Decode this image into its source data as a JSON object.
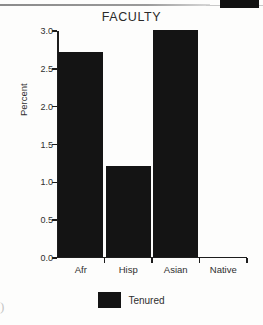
{
  "chart_data": {
    "type": "bar",
    "title": "FACULTY",
    "xlabel": "",
    "ylabel": "Percent",
    "categories": [
      "Afr",
      "Hisp",
      "Asian",
      "Native"
    ],
    "series": [
      {
        "name": "Tenured",
        "values": [
          2.7,
          1.2,
          3.0,
          0.0
        ],
        "color": "#141414"
      }
    ],
    "ylim": [
      0.0,
      3.0
    ],
    "yticks": [
      "0.0",
      "0.5",
      "1.0",
      "1.5",
      "2.0",
      "2.5",
      "3.0"
    ],
    "ytick_values": [
      0.0,
      0.5,
      1.0,
      1.5,
      2.0,
      2.5,
      3.0
    ],
    "grid": false,
    "legend_position": "bottom"
  },
  "legend": {
    "entries": [
      {
        "label": "Tenured",
        "color": "#141414"
      }
    ]
  },
  "artifacts": {
    "corner_glyph": ")"
  }
}
